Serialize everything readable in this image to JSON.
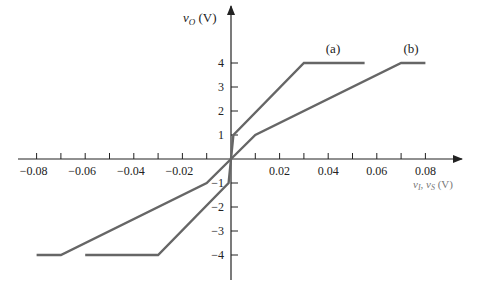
{
  "chart_data": {
    "type": "line",
    "title": "",
    "xlabel": "vI, vS (V)",
    "ylabel": "vO (V)",
    "xlim": [
      -0.08,
      0.08
    ],
    "ylim": [
      -4,
      4
    ],
    "grid": false,
    "legend": "inline labels near curves",
    "x_ticks": [
      -0.08,
      -0.07,
      -0.06,
      -0.05,
      -0.04,
      -0.03,
      -0.02,
      -0.01,
      0.01,
      0.02,
      0.03,
      0.04,
      0.05,
      0.06,
      0.07,
      0.08
    ],
    "x_tick_labels": [
      {
        "value": -0.08,
        "label": "−0.08"
      },
      {
        "value": -0.06,
        "label": "−0.06"
      },
      {
        "value": -0.04,
        "label": "−0.04"
      },
      {
        "value": -0.02,
        "label": "−0.02"
      },
      {
        "value": 0.02,
        "label": "0.02"
      },
      {
        "value": 0.04,
        "label": "0.04"
      },
      {
        "value": 0.06,
        "label": "0.06"
      },
      {
        "value": 0.08,
        "label": "0.08"
      }
    ],
    "y_tick_labels": [
      {
        "value": 4,
        "label": "4"
      },
      {
        "value": 3,
        "label": "3"
      },
      {
        "value": 2,
        "label": "2"
      },
      {
        "value": 1,
        "label": "1"
      },
      {
        "value": -1,
        "label": "−1"
      },
      {
        "value": -2,
        "label": "−2"
      },
      {
        "value": -3,
        "label": "−3"
      },
      {
        "value": -4,
        "label": "−4"
      }
    ],
    "series": [
      {
        "name": "(a)",
        "x": [
          -0.06,
          -0.03,
          -0.001,
          0,
          0.001,
          0.03,
          0.055
        ],
        "y": [
          -4,
          -4,
          -1,
          0,
          1,
          4,
          4
        ]
      },
      {
        "name": "(b)",
        "x": [
          -0.08,
          -0.07,
          -0.01,
          0,
          0.01,
          0.07,
          0.08
        ],
        "y": [
          -4,
          -4,
          -1,
          0,
          1,
          4,
          4
        ]
      }
    ],
    "annotations": [
      {
        "text": "(a)",
        "x": 0.043,
        "y": 4.6
      },
      {
        "text": "(b)",
        "x": 0.073,
        "y": 4.6
      }
    ]
  },
  "labels": {
    "ylabel_main": "v",
    "ylabel_sub": "O",
    "ylabel_unit": " (V)",
    "xlabel_v1": "v",
    "xlabel_sub1": "I",
    "xlabel_sep": ", ",
    "xlabel_v2": "v",
    "xlabel_sub2": "S",
    "xlabel_unit": " (V)",
    "series_a": "(a)",
    "series_b": "(b)"
  },
  "colors": {
    "curve": "#666666",
    "axis": "#222222"
  }
}
